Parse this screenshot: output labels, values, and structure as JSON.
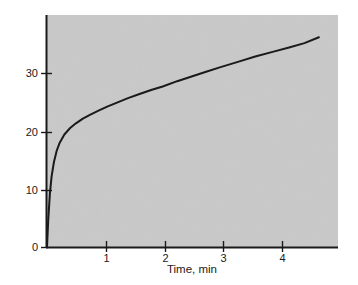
{
  "figure": {
    "background_color": "#ffffff",
    "plot_background_color": "#c9c9c9",
    "axis_color": "#1a1a1a",
    "curve_color": "#1a1a1a"
  },
  "chart_data": {
    "type": "line",
    "title": "",
    "xlabel": "Time, min",
    "ylabel": "Nitrophenol concentration, μM",
    "xlim": [
      0,
      5.03
    ],
    "ylim": [
      0,
      39.7
    ],
    "xticks": [
      1,
      2,
      3,
      4
    ],
    "xtick_labels": [
      "1",
      "2",
      "3",
      "4"
    ],
    "yticks": [
      0,
      10,
      20,
      30
    ],
    "ytick_labels": [
      "0",
      "10",
      "20",
      "30"
    ],
    "grid": false,
    "legend": null,
    "series": [
      {
        "name": "Nitrophenol concentration",
        "x": [
          0.0,
          0.02,
          0.05,
          0.08,
          0.12,
          0.17,
          0.22,
          0.3,
          0.4,
          0.5,
          0.62,
          0.75,
          0.9,
          1.05,
          1.2,
          1.4,
          1.6,
          1.8,
          2.0,
          2.25,
          2.5,
          2.75,
          3.0,
          3.3,
          3.6,
          3.9,
          4.2,
          4.45,
          4.7
        ],
        "y": [
          0.0,
          4.5,
          9.2,
          12.2,
          14.6,
          16.6,
          17.9,
          19.3,
          20.4,
          21.2,
          22.0,
          22.7,
          23.4,
          24.1,
          24.7,
          25.5,
          26.2,
          26.9,
          27.5,
          28.4,
          29.2,
          30.0,
          30.8,
          31.7,
          32.6,
          33.4,
          34.2,
          34.9,
          35.9
        ]
      }
    ]
  }
}
